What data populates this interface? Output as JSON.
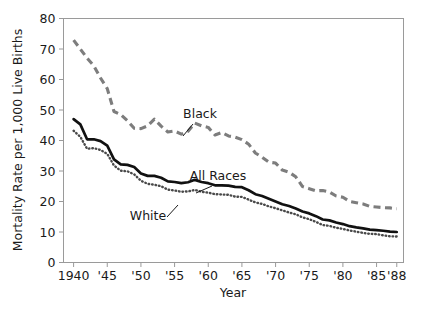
{
  "chart_data": {
    "type": "line",
    "title": "",
    "xlabel": "Year",
    "ylabel": "Mortality Rate per 1,000 Live Births",
    "xlim": [
      1938.5,
      1989.0
    ],
    "ylim": [
      0,
      80
    ],
    "grid": false,
    "legend_position": "inline-annotations",
    "x_tick_values": [
      1940,
      1945,
      1950,
      1955,
      1960,
      1965,
      1970,
      1975,
      1980,
      1985,
      1988
    ],
    "x_tick_labels": [
      "1940",
      "'45",
      "'50",
      "'55",
      "'60",
      "'65",
      "'70",
      "'75",
      "'80",
      "'85",
      "'88"
    ],
    "y_tick_values": [
      0,
      10,
      20,
      30,
      40,
      50,
      60,
      70,
      80
    ],
    "y_tick_labels": [
      "0",
      "10",
      "20",
      "30",
      "40",
      "50",
      "60",
      "70",
      "80"
    ],
    "x": [
      1940,
      1941,
      1942,
      1943,
      1944,
      1945,
      1946,
      1947,
      1948,
      1949,
      1950,
      1951,
      1952,
      1953,
      1954,
      1955,
      1956,
      1957,
      1958,
      1959,
      1960,
      1961,
      1962,
      1963,
      1964,
      1965,
      1966,
      1967,
      1968,
      1969,
      1970,
      1971,
      1972,
      1973,
      1974,
      1975,
      1976,
      1977,
      1978,
      1979,
      1980,
      1981,
      1982,
      1983,
      1984,
      1985,
      1986,
      1987,
      1988
    ],
    "series": [
      {
        "name": "Black",
        "color": "#7d7d7d",
        "style": "dashed",
        "values": [
          72.9,
          70.0,
          67.0,
          64.5,
          60.5,
          57.0,
          49.5,
          48.5,
          46.5,
          44.0,
          43.9,
          44.8,
          47.0,
          44.7,
          42.8,
          43.1,
          42.1,
          43.0,
          45.7,
          44.8,
          44.3,
          41.8,
          42.6,
          41.5,
          41.1,
          40.3,
          38.8,
          35.9,
          34.5,
          32.9,
          32.6,
          30.3,
          29.6,
          28.1,
          24.9,
          24.2,
          23.5,
          23.6,
          23.1,
          21.8,
          21.4,
          20.0,
          19.6,
          19.2,
          18.4,
          18.2,
          18.0,
          17.9,
          17.6
        ]
      },
      {
        "name": "All Races",
        "color": "#111111",
        "style": "solid",
        "values": [
          47.0,
          45.3,
          40.4,
          40.4,
          39.8,
          38.3,
          33.8,
          32.2,
          32.0,
          31.3,
          29.2,
          28.4,
          28.4,
          27.8,
          26.6,
          26.4,
          26.0,
          26.3,
          27.1,
          26.4,
          26.0,
          25.3,
          25.3,
          25.2,
          24.8,
          24.7,
          23.7,
          22.4,
          21.8,
          20.9,
          20.0,
          19.1,
          18.5,
          17.7,
          16.7,
          16.1,
          15.2,
          14.1,
          13.8,
          13.1,
          12.6,
          11.9,
          11.5,
          11.2,
          10.8,
          10.6,
          10.4,
          10.1,
          10.0
        ]
      },
      {
        "name": "White",
        "color": "#4a4a4a",
        "style": "dotted",
        "values": [
          43.2,
          41.2,
          37.3,
          37.5,
          36.9,
          35.6,
          31.8,
          30.1,
          29.9,
          28.9,
          26.8,
          25.8,
          25.5,
          25.0,
          23.9,
          23.6,
          23.2,
          23.3,
          23.8,
          23.2,
          22.9,
          22.4,
          22.3,
          22.2,
          21.6,
          21.5,
          20.6,
          19.7,
          19.2,
          18.4,
          17.8,
          17.1,
          16.4,
          15.8,
          14.8,
          14.2,
          13.3,
          12.3,
          12.0,
          11.4,
          11.0,
          10.5,
          10.1,
          9.7,
          9.4,
          9.3,
          8.9,
          8.6,
          8.5
        ]
      }
    ],
    "annotations": [
      {
        "label": "Black",
        "x_px": 200,
        "y_px": 118
      },
      {
        "label": "All Races",
        "x_px": 218,
        "y_px": 180
      },
      {
        "label": "White",
        "x_px": 148,
        "y_px": 220
      }
    ]
  },
  "axis": {
    "x_title": "Year",
    "y_title": "Mortality Rate per 1,000 Live Births"
  }
}
